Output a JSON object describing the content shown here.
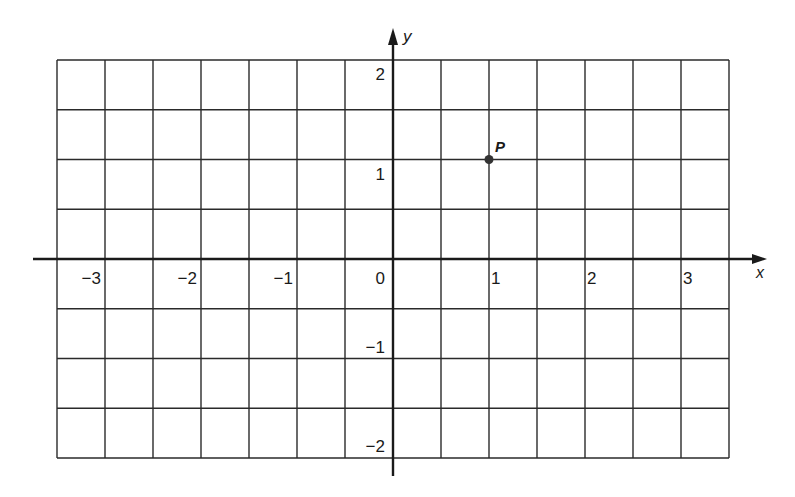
{
  "chart_data": {
    "type": "scatter",
    "title": "",
    "xlabel": "x",
    "ylabel": "y",
    "grid": true,
    "xlim": [
      -3.5,
      3.5
    ],
    "ylim": [
      -2,
      2
    ],
    "grid_step_x": 0.5,
    "grid_step_y": 0.5,
    "x_ticks": [
      -3,
      -2,
      -1,
      0,
      1,
      2,
      3
    ],
    "x_tick_labels": [
      "−3",
      "−2",
      "−1",
      "0",
      "1",
      "2",
      "3"
    ],
    "y_ticks": [
      2,
      1,
      -1,
      -2
    ],
    "y_tick_labels": [
      "2",
      "1",
      "−1",
      "−2"
    ],
    "points": [
      {
        "label": "P",
        "x": 1,
        "y": 1
      }
    ]
  },
  "axes": {
    "x_label": "x",
    "y_label": "y",
    "origin_label": "0"
  },
  "colors": {
    "line": "#2a2a2a",
    "axis": "#1a1a1a",
    "point": "#333333",
    "background": "#ffffff"
  }
}
